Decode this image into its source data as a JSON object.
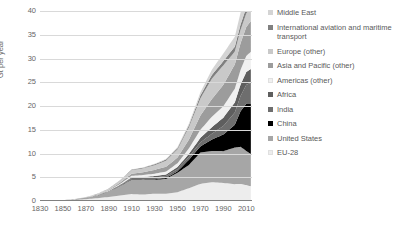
{
  "chart_data": {
    "type": "area",
    "title": "",
    "xlabel": "",
    "ylabel": "Gt per year",
    "xlim": [
      1830,
      2015
    ],
    "ylim": [
      0,
      40
    ],
    "grid": true,
    "stacked": true,
    "legend_position": "right",
    "xticks": [
      "1830",
      "1850",
      "1870",
      "1890",
      "1910",
      "1930",
      "1950",
      "1970",
      "1990",
      "2010"
    ],
    "xtick_values": [
      1830,
      1850,
      1870,
      1890,
      1910,
      1930,
      1950,
      1970,
      1990,
      2010
    ],
    "yticks": [
      "0",
      "5",
      "10",
      "15",
      "20",
      "25",
      "30",
      "35",
      "40"
    ],
    "ytick_values": [
      0,
      5,
      10,
      15,
      20,
      25,
      30,
      35,
      40
    ],
    "x": [
      1830,
      1840,
      1850,
      1860,
      1870,
      1880,
      1890,
      1900,
      1910,
      1920,
      1930,
      1940,
      1950,
      1960,
      1970,
      1980,
      1990,
      2000,
      2005,
      2010,
      2014
    ],
    "series": [
      {
        "name": "EU-28",
        "color": "#ededed",
        "values": [
          0.03,
          0.06,
          0.12,
          0.22,
          0.38,
          0.6,
          0.85,
          1.15,
          1.45,
          1.35,
          1.55,
          1.55,
          1.85,
          2.7,
          3.6,
          3.95,
          3.8,
          3.55,
          3.6,
          3.35,
          3.1
        ]
      },
      {
        "name": "United States",
        "color": "#a6a6a6",
        "values": [
          0.01,
          0.02,
          0.04,
          0.1,
          0.25,
          0.55,
          1.1,
          2.0,
          3.05,
          3.1,
          2.9,
          3.1,
          4.1,
          4.9,
          6.6,
          6.6,
          6.7,
          7.7,
          7.8,
          7.2,
          6.8
        ]
      },
      {
        "name": "China",
        "color": "#000000",
        "values": [
          0.0,
          0.0,
          0.0,
          0.0,
          0.0,
          0.01,
          0.02,
          0.05,
          0.08,
          0.1,
          0.15,
          0.2,
          0.3,
          1.1,
          1.3,
          2.4,
          3.5,
          4.8,
          7.5,
          9.9,
          10.5
        ]
      },
      {
        "name": "India",
        "color": "#6e6e6e",
        "values": [
          0.0,
          0.0,
          0.0,
          0.01,
          0.02,
          0.04,
          0.08,
          0.15,
          0.25,
          0.3,
          0.35,
          0.4,
          0.45,
          0.6,
          0.85,
          1.2,
          1.8,
          2.6,
          3.2,
          4.0,
          4.5
        ]
      },
      {
        "name": "Africa",
        "color": "#5e5e5e",
        "values": [
          0.0,
          0.0,
          0.0,
          0.01,
          0.02,
          0.03,
          0.06,
          0.1,
          0.18,
          0.22,
          0.3,
          0.35,
          0.45,
          0.65,
          0.95,
          1.4,
          1.75,
          2.1,
          2.4,
          2.7,
          2.9
        ]
      },
      {
        "name": "Americas (other)",
        "color": "#f0f0f0",
        "values": [
          0.0,
          0.0,
          0.01,
          0.02,
          0.03,
          0.05,
          0.1,
          0.18,
          0.3,
          0.4,
          0.5,
          0.6,
          0.8,
          1.15,
          1.7,
          2.2,
          2.4,
          2.9,
          3.1,
          3.4,
          3.6
        ]
      },
      {
        "name": "Asia and Pacific (other)",
        "color": "#9c9c9c",
        "values": [
          0.0,
          0.0,
          0.01,
          0.02,
          0.04,
          0.07,
          0.14,
          0.25,
          0.45,
          0.6,
          0.8,
          1.0,
          1.2,
          1.85,
          3.0,
          3.7,
          4.5,
          5.1,
          5.6,
          6.1,
          6.5
        ]
      },
      {
        "name": "Europe (other)",
        "color": "#c9c9c9",
        "values": [
          0.0,
          0.01,
          0.02,
          0.04,
          0.08,
          0.14,
          0.25,
          0.45,
          0.75,
          0.8,
          1.0,
          1.3,
          1.7,
          2.6,
          3.6,
          4.3,
          4.1,
          2.7,
          2.8,
          2.8,
          2.8
        ]
      },
      {
        "name": "International aviation and maritime transport",
        "color": "#808080",
        "values": [
          0.0,
          0.0,
          0.0,
          0.0,
          0.01,
          0.02,
          0.03,
          0.06,
          0.1,
          0.14,
          0.18,
          0.22,
          0.28,
          0.4,
          0.65,
          0.8,
          0.9,
          1.05,
          1.15,
          1.25,
          1.3
        ]
      },
      {
        "name": "Middle East",
        "color": "#d4d4d4",
        "values": [
          0.0,
          0.0,
          0.0,
          0.0,
          0.0,
          0.01,
          0.01,
          0.02,
          0.04,
          0.06,
          0.1,
          0.15,
          0.22,
          0.35,
          0.65,
          1.1,
          1.6,
          2.1,
          2.5,
          2.9,
          3.2
        ]
      }
    ]
  },
  "legend": {
    "items": [
      {
        "label": "Middle East",
        "color": "#d4d4d4"
      },
      {
        "label": "International aviation and maritime transport",
        "color": "#808080"
      },
      {
        "label": "Europe (other)",
        "color": "#c9c9c9"
      },
      {
        "label": "Asia and Pacific (other)",
        "color": "#9c9c9c"
      },
      {
        "label": "Americas (other)",
        "color": "#f0f0f0"
      },
      {
        "label": "Africa",
        "color": "#5e5e5e"
      },
      {
        "label": "India",
        "color": "#6e6e6e"
      },
      {
        "label": "China",
        "color": "#000000"
      },
      {
        "label": "United States",
        "color": "#a6a6a6"
      },
      {
        "label": "EU-28",
        "color": "#ededed"
      }
    ]
  },
  "axes": {
    "y_title": "Gt per year",
    "grid_color": "#d9d9d9",
    "axis_color": "#808080",
    "tick_text_color": "#666666"
  }
}
